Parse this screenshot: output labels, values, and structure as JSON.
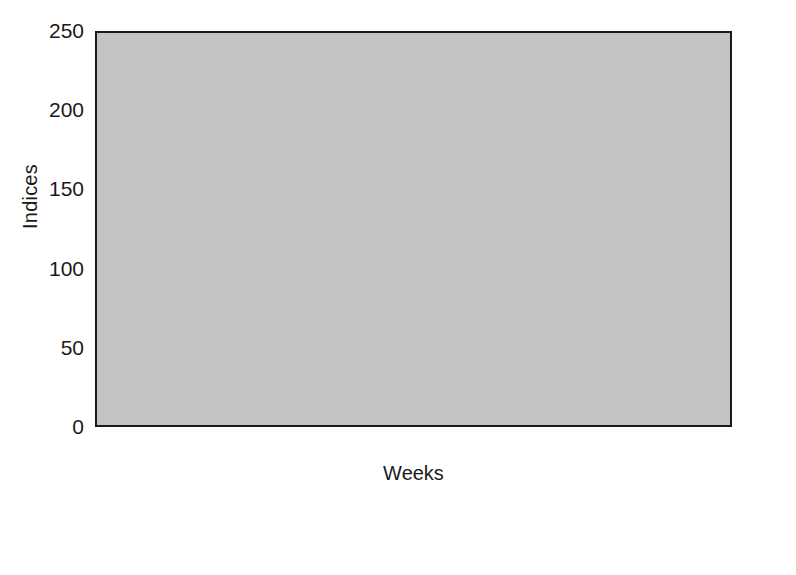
{
  "chart_data": {
    "type": "bar",
    "subtype": "grouped-stacked",
    "title": "",
    "xlabel": "Weeks",
    "ylabel": "Indices",
    "categories": [
      "1",
      "2",
      "3",
      "4",
      "5",
      "6",
      "7",
      "8",
      "9",
      "10"
    ],
    "ylim": [
      0,
      250
    ],
    "yticks": [
      0,
      50,
      100,
      150,
      200,
      250
    ],
    "ytick_labels": [
      "0",
      "50",
      "100",
      "150",
      "200",
      "250"
    ],
    "grid": false,
    "legend_position": "below-axes",
    "plot_background": "#c3c3c3",
    "series": [
      {
        "name": "Hourly index",
        "key": "hourly_index",
        "stack": "left",
        "style": "solid-dark-gray",
        "color": "#585858",
        "values": [
          97,
          107,
          101,
          90,
          111,
          95,
          90,
          98,
          91,
          91
        ]
      },
      {
        "name": "Cleaner index",
        "key": "cleaner_index",
        "stack": "left",
        "style": "solid-white",
        "color": "#fbfbfb",
        "note": "stacked above Hourly index; values are the segment totals (bar top)",
        "values": [
          199,
          218,
          181,
          191,
          242,
          179,
          172,
          191,
          165,
          169
        ]
      },
      {
        "name": "Per hour",
        "key": "per_hour",
        "stack": "right",
        "style": "solid-black",
        "color": "#1c1c1c",
        "values": [
          17,
          19,
          18,
          16,
          20,
          17,
          15,
          18,
          17,
          16
        ]
      },
      {
        "name": "Per cleaner",
        "key": "per_cleaner",
        "stack": "right",
        "style": "diagonal-hatch",
        "color": "#d9d9d9",
        "note": "stacked above Per hour; values are the segment totals (bar top)",
        "values": [
          181,
          196,
          146,
          181,
          234,
          152,
          150,
          168,
          138,
          145
        ]
      }
    ]
  },
  "axes": {
    "y_title": "Indices",
    "x_title": "Weeks"
  },
  "legend": {
    "items": [
      {
        "label": "Hourly index",
        "swatch": "solid-dark-gray"
      },
      {
        "label": "Cleaner index",
        "swatch": "solid-white"
      },
      {
        "label": "Per hour",
        "swatch": "solid-black"
      },
      {
        "label": "Per cleaner",
        "swatch": "diagonal-hatch"
      }
    ]
  }
}
